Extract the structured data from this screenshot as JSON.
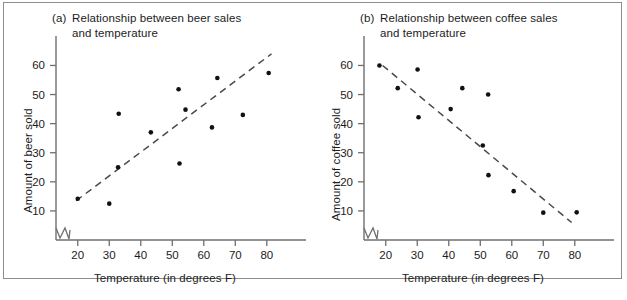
{
  "figure": {
    "background_color": "#ffffff",
    "border_color": "#8d8d8d",
    "point_color": "#111111",
    "axis_color": "#6f6f6f",
    "trend_line_color": "#4a4a4a",
    "text_color": "#1c1c1c"
  },
  "chart_data": [
    {
      "type": "scatter",
      "panel_tag": "(a)",
      "title": "Relationship between beer sales and temperature",
      "title_line1": "Relationship between beer sales",
      "title_line2": "and temperature",
      "xlabel": "Temperature (in degrees F)",
      "ylabel": "Amount of beer sold",
      "xlim": [
        15,
        88
      ],
      "ylim": [
        0,
        66
      ],
      "xticks": [
        20,
        30,
        40,
        50,
        60,
        70,
        80
      ],
      "yticks": [
        10,
        20,
        30,
        40,
        50,
        60
      ],
      "xtick_labels": [
        "20",
        "30",
        "40",
        "50",
        "60",
        "70",
        "80"
      ],
      "ytick_labels": [
        "10",
        "20",
        "30",
        "40",
        "50",
        "60"
      ],
      "grid": false,
      "legend": "none",
      "axis_break": true,
      "trend_line": {
        "style": "dashed",
        "x_start": 19.5,
        "y_start": 13.5,
        "x_end": 81.5,
        "y_end": 64.0
      },
      "points": [
        {
          "x": 20.0,
          "y": 14.2
        },
        {
          "x": 30.0,
          "y": 12.5
        },
        {
          "x": 32.8,
          "y": 25.0
        },
        {
          "x": 33.0,
          "y": 43.4
        },
        {
          "x": 43.2,
          "y": 37.0
        },
        {
          "x": 52.0,
          "y": 51.8
        },
        {
          "x": 52.3,
          "y": 26.3
        },
        {
          "x": 54.2,
          "y": 44.8
        },
        {
          "x": 62.6,
          "y": 38.7
        },
        {
          "x": 64.3,
          "y": 55.7
        },
        {
          "x": 72.4,
          "y": 43.0
        },
        {
          "x": 80.6,
          "y": 57.4
        }
      ]
    },
    {
      "type": "scatter",
      "panel_tag": "(b)",
      "title": "Relationship between coffee sales and temperature",
      "title_line1": "Relationship between coffee sales",
      "title_line2": "and temperature",
      "xlabel": "Temperature (in degrees F)",
      "ylabel": "Amount of coffee sold",
      "xlim": [
        15,
        88
      ],
      "ylim": [
        0,
        66
      ],
      "xticks": [
        20,
        30,
        40,
        50,
        60,
        70,
        80
      ],
      "yticks": [
        10,
        20,
        30,
        40,
        50,
        60
      ],
      "xtick_labels": [
        "20",
        "30",
        "40",
        "50",
        "60",
        "70",
        "80"
      ],
      "ytick_labels": [
        "10",
        "20",
        "30",
        "40",
        "50",
        "60"
      ],
      "grid": false,
      "legend": "none",
      "axis_break": true,
      "trend_line": {
        "style": "dashed",
        "x_start": 19.0,
        "y_start": 60.0,
        "x_end": 79.0,
        "y_end": 6.0
      },
      "points": [
        {
          "x": 18.0,
          "y": 60.0
        },
        {
          "x": 23.8,
          "y": 52.2
        },
        {
          "x": 30.1,
          "y": 58.6
        },
        {
          "x": 30.4,
          "y": 42.2
        },
        {
          "x": 40.6,
          "y": 45.0
        },
        {
          "x": 44.3,
          "y": 52.2
        },
        {
          "x": 52.5,
          "y": 50.0
        },
        {
          "x": 50.8,
          "y": 32.5
        },
        {
          "x": 52.6,
          "y": 22.3
        },
        {
          "x": 60.6,
          "y": 16.8
        },
        {
          "x": 70.0,
          "y": 9.4
        },
        {
          "x": 80.6,
          "y": 9.5
        }
      ]
    }
  ]
}
